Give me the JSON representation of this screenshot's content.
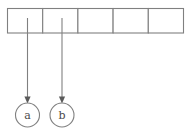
{
  "diagram": {
    "type": "array-with-pointers",
    "background_color": "#ffffff",
    "line_color": "#808080",
    "text_color": "#4a4a4a",
    "array": {
      "cell_count": 5,
      "x_start": 7,
      "x_end": 183,
      "y_top": 8,
      "y_bottom": 33,
      "cells": [
        {
          "index": 0,
          "label": ""
        },
        {
          "index": 1,
          "label": ""
        },
        {
          "index": 2,
          "label": ""
        },
        {
          "index": 3,
          "label": ""
        },
        {
          "index": 4,
          "label": ""
        }
      ]
    },
    "pointers": [
      {
        "id": "pointer-a",
        "label": "a",
        "source_cell_index": 0,
        "x": 27.5,
        "y_start": 18,
        "y_end": 102,
        "circle_center_x": 27.5,
        "circle_center_y": 115,
        "circle_radius": 12
      },
      {
        "id": "pointer-b",
        "label": "b",
        "source_cell_index": 1,
        "x": 62,
        "y_start": 18,
        "y_end": 102,
        "circle_center_x": 62,
        "circle_center_y": 115,
        "circle_radius": 12
      }
    ]
  }
}
